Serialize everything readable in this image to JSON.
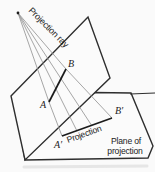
{
  "diagram": {
    "description_labels": {
      "projection_ray": "Projection ray",
      "projection": "Projection",
      "plane_of_line1": "Plane of",
      "plane_of_line2": "projection"
    },
    "points": {
      "a": "A",
      "b": "B",
      "a_prime": "A′",
      "b_prime": "B′"
    },
    "colors": {
      "background": "#fafafa",
      "outline": "#2e2e2e",
      "ray": "#8f8f8f",
      "thick_segment": "#1b1b1b",
      "text": "#222222"
    }
  }
}
